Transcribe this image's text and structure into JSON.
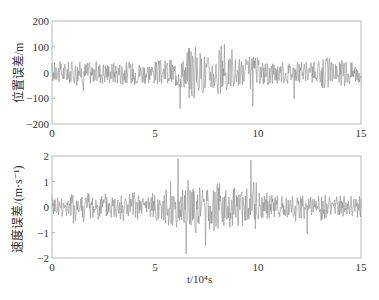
{
  "chart_data": [
    {
      "type": "line",
      "title": "",
      "xlabel": "t/10⁴s",
      "ylabel": "位置误差/m",
      "xlim": [
        0,
        15
      ],
      "ylim": [
        -200,
        200
      ],
      "xticks": [
        0,
        5,
        10,
        15
      ],
      "yticks": [
        200,
        100,
        0,
        -100,
        -200
      ],
      "grid": false,
      "legend": null,
      "series": [
        {
          "name": "位置误差",
          "color": "#8a8a8a",
          "description": "zero-mean noise, mostly within ±100 m, occasional spikes to ±200 m around t≈6.5–8",
          "x": [
            0,
            0.5,
            1,
            1.5,
            2,
            2.5,
            3,
            3.5,
            4,
            4.5,
            5,
            5.5,
            6,
            6.5,
            7,
            7.5,
            8,
            8.5,
            9,
            9.5,
            10,
            10.5,
            11,
            11.5,
            12,
            12.5,
            13,
            13.5,
            14,
            14.5,
            15
          ],
          "y": [
            0,
            60,
            -60,
            70,
            -80,
            60,
            -70,
            80,
            -75,
            70,
            -90,
            100,
            -110,
            200,
            -150,
            130,
            -200,
            110,
            -100,
            120,
            -90,
            90,
            -80,
            80,
            -70,
            75,
            -110,
            70,
            -100,
            60,
            0
          ]
        }
      ]
    },
    {
      "type": "line",
      "title": "",
      "xlabel": "t/10⁴s",
      "ylabel": "速度误差/(m·s⁻¹)",
      "xlim": [
        0,
        15
      ],
      "ylim": [
        -2,
        2
      ],
      "xticks": [
        0,
        5,
        10,
        15
      ],
      "yticks": [
        2,
        1,
        0,
        -1,
        -2
      ],
      "grid": false,
      "legend": null,
      "series": [
        {
          "name": "速度误差",
          "color": "#8a8a8a",
          "description": "zero-mean noise, mostly within ±1 m/s, spikes to ±2 around t≈6.5–9.5",
          "x": [
            0,
            0.5,
            1,
            1.5,
            2,
            2.5,
            3,
            3.5,
            4,
            4.5,
            5,
            5.5,
            6,
            6.5,
            7,
            7.5,
            8,
            8.5,
            9,
            9.5,
            10,
            10.5,
            11,
            11.5,
            12,
            12.5,
            13,
            13.5,
            14,
            14.5,
            15
          ],
          "y": [
            0,
            0.9,
            -1.2,
            1.1,
            -0.9,
            1.0,
            -1.0,
            1.1,
            -0.9,
            1.0,
            -1.0,
            1.3,
            -1.4,
            2.0,
            -1.5,
            1.8,
            -1.7,
            1.5,
            -1.4,
            2.0,
            -1.0,
            0.9,
            -0.8,
            0.8,
            -0.9,
            0.8,
            -0.9,
            0.7,
            -0.8,
            0.7,
            0
          ]
        }
      ]
    }
  ],
  "plots": {
    "top": {
      "ylabel": "位置误差/m",
      "yticks": [
        "200",
        "100",
        "0",
        "−100",
        "−200"
      ],
      "xticks": [
        "0",
        "5",
        "10",
        "15"
      ],
      "amp": 0.25,
      "spike_amp": 0.5,
      "seed": 17
    },
    "bottom": {
      "ylabel": "速度误差/(m·s⁻¹)",
      "yticks": [
        "2",
        "1",
        "0",
        "−1",
        "−2"
      ],
      "xticks": [
        "0",
        "5",
        "10",
        "15"
      ],
      "amp": 0.25,
      "spike_amp": 0.5,
      "seed": 41
    },
    "xlabel": "t/10⁴s",
    "line_color": "#8c8c8c",
    "axis_color": "#b8b8b8"
  }
}
